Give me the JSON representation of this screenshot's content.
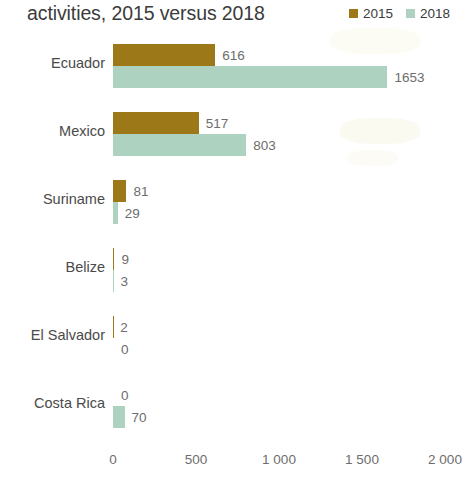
{
  "chart_data": {
    "type": "bar",
    "orientation": "horizontal",
    "title": "activities, 2015 versus 2018",
    "xlabel": "",
    "ylabel": "",
    "xlim": [
      0,
      2000
    ],
    "grid": false,
    "legend_position": "top-right",
    "categories": [
      "Ecuador",
      "Mexico",
      "Suriname",
      "Belize",
      "El Salvador",
      "Costa Rica"
    ],
    "tick_labels": [
      "0",
      "500",
      "1 000",
      "1 500",
      "2 000"
    ],
    "tick_values": [
      0,
      500,
      1000,
      1500,
      2000
    ],
    "series": [
      {
        "name": "2015",
        "color": "#9c7819",
        "values": [
          616,
          517,
          81,
          9,
          2,
          0
        ],
        "value_labels": [
          "616",
          "517",
          "81",
          "9",
          "2",
          "0"
        ]
      },
      {
        "name": "2018",
        "color": "#aed2c0",
        "values": [
          1653,
          803,
          29,
          3,
          0,
          70
        ],
        "value_labels": [
          "1653",
          "803",
          "29",
          "3",
          "0",
          "70"
        ]
      }
    ]
  },
  "legend": {
    "items": [
      {
        "label": "2015",
        "color": "#9c7819"
      },
      {
        "label": "2018",
        "color": "#aed2c0"
      }
    ]
  }
}
